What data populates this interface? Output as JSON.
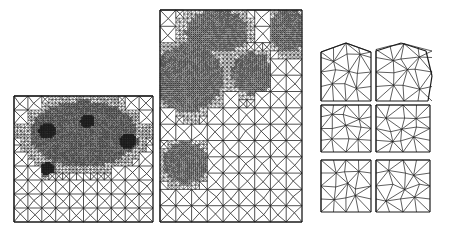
{
  "figure": {
    "stroke_color": "#1a1a1a",
    "background": "#ffffff",
    "panels": [
      {
        "id": "mesh-square-refined",
        "bbox": [
          14,
          96,
          153,
          222
        ],
        "base_cells": [
          10,
          9
        ],
        "refinement_zones": [
          {
            "cx": 0.5,
            "cy": 0.3,
            "rx": 0.38,
            "ry": 0.26,
            "level": 3
          },
          {
            "cx": 0.24,
            "cy": 0.28,
            "r": 0.06,
            "level": 5,
            "dark": true
          },
          {
            "cx": 0.53,
            "cy": 0.2,
            "r": 0.05,
            "level": 5,
            "dark": true
          },
          {
            "cx": 0.82,
            "cy": 0.36,
            "r": 0.06,
            "level": 5,
            "dark": true
          },
          {
            "cx": 0.24,
            "cy": 0.58,
            "r": 0.05,
            "level": 5,
            "dark": true
          }
        ]
      },
      {
        "id": "mesh-rectangle-refined",
        "bbox": [
          160,
          10,
          302,
          222
        ],
        "base_cells": [
          9,
          13
        ],
        "refinement_zones": [
          {
            "cx": 0.4,
            "cy": 0.1,
            "rx": 0.22,
            "ry": 0.1,
            "level": 3
          },
          {
            "cx": 0.9,
            "cy": 0.1,
            "rx": 0.14,
            "ry": 0.1,
            "level": 3
          },
          {
            "cx": 0.2,
            "cy": 0.32,
            "rx": 0.24,
            "ry": 0.16,
            "level": 3
          },
          {
            "cx": 0.65,
            "cy": 0.3,
            "rx": 0.14,
            "ry": 0.1,
            "level": 3
          },
          {
            "cx": 0.18,
            "cy": 0.72,
            "rx": 0.16,
            "ry": 0.1,
            "level": 3
          }
        ]
      },
      {
        "id": "small-mesh-1",
        "bbox": [
          321,
          43,
          371,
          101
        ],
        "shape": "pentagon",
        "base_cells": [
          4,
          4
        ]
      },
      {
        "id": "small-mesh-2",
        "bbox": [
          376,
          43,
          432,
          101
        ],
        "shape": "hexagon",
        "base_cells": [
          4,
          4
        ]
      },
      {
        "id": "small-mesh-3",
        "bbox": [
          321,
          105,
          371,
          152
        ],
        "shape": "square",
        "base_cells": [
          4,
          4
        ]
      },
      {
        "id": "small-mesh-4",
        "bbox": [
          376,
          105,
          430,
          152
        ],
        "shape": "square",
        "base_cells": [
          4,
          4
        ]
      },
      {
        "id": "small-mesh-5",
        "bbox": [
          321,
          160,
          371,
          212
        ],
        "shape": "square",
        "base_cells": [
          4,
          4
        ]
      },
      {
        "id": "small-mesh-6",
        "bbox": [
          376,
          160,
          430,
          212
        ],
        "shape": "square",
        "base_cells": [
          4,
          4
        ]
      }
    ]
  }
}
